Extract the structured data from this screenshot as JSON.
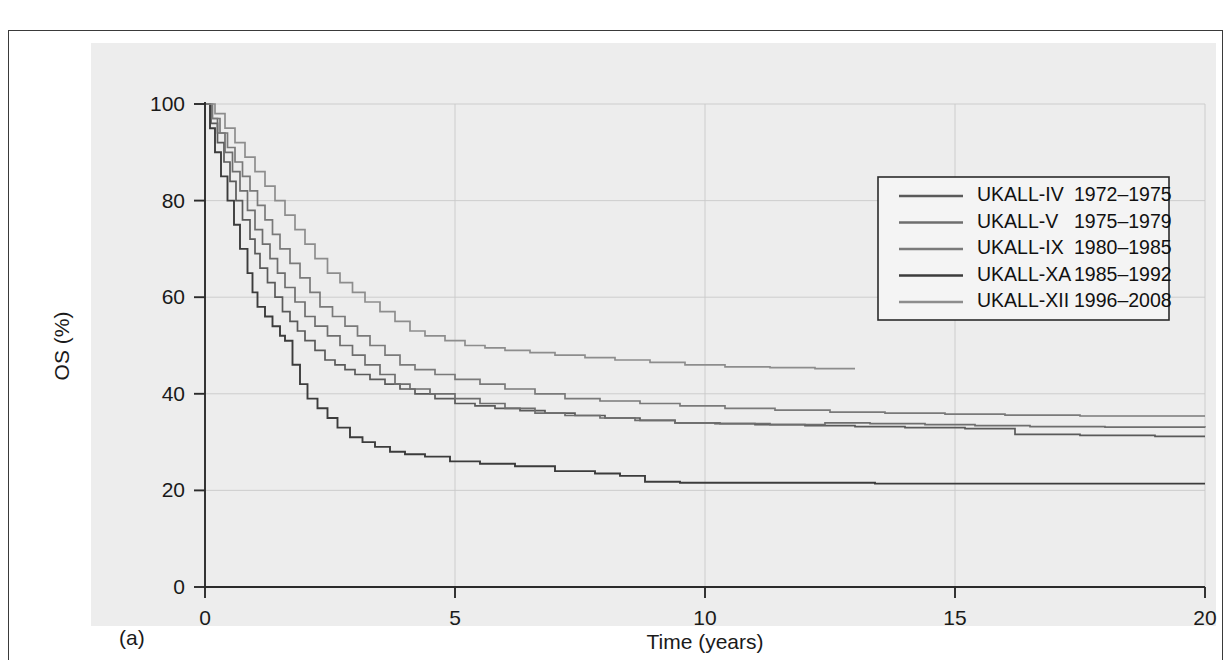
{
  "figure": {
    "panel_label": "(a)",
    "caption_remnant": ""
  },
  "chart_data": {
    "type": "line",
    "subtype": "kaplan-meier-step",
    "title": "",
    "xlabel": "Time (years)",
    "ylabel": "OS (%)",
    "xlim": [
      0,
      20
    ],
    "ylim": [
      0,
      100
    ],
    "xticks": [
      0,
      5,
      10,
      15,
      20
    ],
    "yticks": [
      0,
      20,
      40,
      60,
      80,
      100
    ],
    "xtick_labels": [
      "0",
      "5",
      "10",
      "15",
      "20"
    ],
    "ytick_labels": [
      "0",
      "20",
      "40",
      "60",
      "80",
      "100"
    ],
    "grid": "horizontal-and-vertical-light",
    "legend_position": "top-right-inside",
    "colors": {
      "ukall_iv": "#5a5a5a",
      "ukall_v": "#6e6e6e",
      "ukall_ix": "#7a7a7a",
      "ukall_xa": "#3c3c3c",
      "ukall_xii": "#8d8d8d",
      "axis": "#2b2b2b",
      "grid": "#c9c9c9",
      "panel_background": "#ededed",
      "legend_background": "#f4f4f4"
    },
    "series": [
      {
        "name": "UKALL-IV",
        "trial_label": "UKALL-IV",
        "years": "1972–1975",
        "color": "#5a5a5a",
        "points": [
          [
            0,
            100
          ],
          [
            0.12,
            96
          ],
          [
            0.25,
            92
          ],
          [
            0.38,
            88
          ],
          [
            0.5,
            84
          ],
          [
            0.62,
            80
          ],
          [
            0.75,
            76
          ],
          [
            0.9,
            72
          ],
          [
            1.0,
            69
          ],
          [
            1.1,
            66
          ],
          [
            1.25,
            63
          ],
          [
            1.4,
            60
          ],
          [
            1.55,
            57
          ],
          [
            1.7,
            55
          ],
          [
            1.85,
            53
          ],
          [
            2.0,
            51
          ],
          [
            2.2,
            49
          ],
          [
            2.4,
            47
          ],
          [
            2.6,
            46
          ],
          [
            2.8,
            45
          ],
          [
            3.0,
            44
          ],
          [
            3.3,
            43
          ],
          [
            3.6,
            42
          ],
          [
            3.9,
            41
          ],
          [
            4.2,
            40
          ],
          [
            4.6,
            39
          ],
          [
            5.0,
            38
          ],
          [
            5.4,
            37.5
          ],
          [
            5.8,
            37
          ],
          [
            6.3,
            36.5
          ],
          [
            6.8,
            36
          ],
          [
            7.4,
            35.5
          ],
          [
            8.0,
            35
          ],
          [
            8.7,
            34.5
          ],
          [
            9.4,
            34
          ],
          [
            10.2,
            33.8
          ],
          [
            11.0,
            33.6
          ],
          [
            12.0,
            33.4
          ],
          [
            13.0,
            33.2
          ],
          [
            14.0,
            33.0
          ],
          [
            15.2,
            32.8
          ],
          [
            16.2,
            31.6
          ],
          [
            17.5,
            31.4
          ],
          [
            19.0,
            31.2
          ],
          [
            20,
            31.2
          ]
        ],
        "final_value": 31
      },
      {
        "name": "UKALL-V",
        "trial_label": "UKALL-V",
        "years": "1975–1979",
        "color": "#6e6e6e",
        "points": [
          [
            0,
            100
          ],
          [
            0.12,
            97
          ],
          [
            0.25,
            94
          ],
          [
            0.4,
            90
          ],
          [
            0.55,
            86
          ],
          [
            0.7,
            82
          ],
          [
            0.85,
            78
          ],
          [
            1.0,
            74
          ],
          [
            1.15,
            71
          ],
          [
            1.3,
            68
          ],
          [
            1.45,
            65
          ],
          [
            1.6,
            62
          ],
          [
            1.8,
            59
          ],
          [
            2.0,
            56
          ],
          [
            2.2,
            54
          ],
          [
            2.45,
            52
          ],
          [
            2.7,
            50
          ],
          [
            2.95,
            48
          ],
          [
            3.2,
            46
          ],
          [
            3.5,
            44
          ],
          [
            3.8,
            42
          ],
          [
            4.1,
            41
          ],
          [
            4.5,
            40
          ],
          [
            5.0,
            39
          ],
          [
            5.5,
            38
          ],
          [
            6.0,
            37
          ],
          [
            6.6,
            36
          ],
          [
            7.2,
            35.5
          ],
          [
            7.9,
            35
          ],
          [
            8.6,
            34.5
          ],
          [
            9.4,
            34
          ],
          [
            10.3,
            33.8
          ],
          [
            11.3,
            33.6
          ],
          [
            12.4,
            34
          ],
          [
            13.3,
            33.8
          ],
          [
            14.4,
            33.6
          ],
          [
            15.4,
            33.4
          ],
          [
            16.5,
            33.2
          ],
          [
            18.0,
            33.1
          ],
          [
            20,
            33
          ]
        ],
        "final_value": 33
      },
      {
        "name": "UKALL-IX",
        "trial_label": "UKALL-IX",
        "years": "1980–1985",
        "color": "#7a7a7a",
        "points": [
          [
            0,
            100
          ],
          [
            0.15,
            97
          ],
          [
            0.3,
            94
          ],
          [
            0.45,
            91
          ],
          [
            0.6,
            88
          ],
          [
            0.75,
            85
          ],
          [
            0.9,
            82
          ],
          [
            1.05,
            79
          ],
          [
            1.2,
            76
          ],
          [
            1.35,
            73
          ],
          [
            1.5,
            70
          ],
          [
            1.7,
            67
          ],
          [
            1.9,
            64
          ],
          [
            2.1,
            61
          ],
          [
            2.3,
            58
          ],
          [
            2.55,
            56
          ],
          [
            2.8,
            54
          ],
          [
            3.05,
            52
          ],
          [
            3.3,
            50
          ],
          [
            3.6,
            48
          ],
          [
            3.9,
            46
          ],
          [
            4.2,
            45
          ],
          [
            4.6,
            44
          ],
          [
            5.0,
            43
          ],
          [
            5.5,
            42
          ],
          [
            6.0,
            41
          ],
          [
            6.6,
            40
          ],
          [
            7.2,
            39
          ],
          [
            7.9,
            38.5
          ],
          [
            8.7,
            38
          ],
          [
            9.5,
            37.5
          ],
          [
            10.4,
            37
          ],
          [
            11.4,
            36.6
          ],
          [
            12.5,
            36.2
          ],
          [
            13.6,
            36
          ],
          [
            14.8,
            35.8
          ],
          [
            16.0,
            35.6
          ],
          [
            17.5,
            35.4
          ],
          [
            20,
            35.4
          ]
        ],
        "final_value": 35
      },
      {
        "name": "UKALL-XA",
        "trial_label": "UKALL-XA",
        "years": "1985–1992",
        "color": "#3c3c3c",
        "points": [
          [
            0,
            100
          ],
          [
            0.1,
            95
          ],
          [
            0.2,
            90
          ],
          [
            0.32,
            85
          ],
          [
            0.45,
            80
          ],
          [
            0.58,
            75
          ],
          [
            0.7,
            70
          ],
          [
            0.85,
            65
          ],
          [
            0.95,
            61
          ],
          [
            1.05,
            58
          ],
          [
            1.2,
            56
          ],
          [
            1.35,
            54
          ],
          [
            1.5,
            52
          ],
          [
            1.6,
            51
          ],
          [
            1.75,
            46
          ],
          [
            1.9,
            42
          ],
          [
            2.05,
            39
          ],
          [
            2.25,
            37
          ],
          [
            2.45,
            35
          ],
          [
            2.65,
            33
          ],
          [
            2.9,
            31
          ],
          [
            3.15,
            30
          ],
          [
            3.4,
            29
          ],
          [
            3.7,
            28
          ],
          [
            4.0,
            27.5
          ],
          [
            4.4,
            27
          ],
          [
            4.9,
            26
          ],
          [
            5.5,
            25.5
          ],
          [
            6.2,
            25
          ],
          [
            7.0,
            24
          ],
          [
            7.8,
            23.5
          ],
          [
            8.3,
            23
          ],
          [
            8.8,
            21.8
          ],
          [
            9.5,
            21.6
          ],
          [
            10.5,
            21.6
          ],
          [
            11.5,
            21.6
          ],
          [
            12.5,
            21.6
          ],
          [
            13.0,
            21.6
          ],
          [
            13.4,
            21.4
          ],
          [
            15.0,
            21.4
          ],
          [
            17.0,
            21.4
          ],
          [
            20,
            21.4
          ]
        ],
        "final_value": 21
      },
      {
        "name": "UKALL-XII",
        "trial_label": "UKALL-XII",
        "years": "1996–2008",
        "color": "#8d8d8d",
        "points": [
          [
            0,
            100
          ],
          [
            0.2,
            98
          ],
          [
            0.4,
            95
          ],
          [
            0.6,
            92
          ],
          [
            0.8,
            89
          ],
          [
            1.0,
            86
          ],
          [
            1.2,
            83
          ],
          [
            1.4,
            80
          ],
          [
            1.6,
            77
          ],
          [
            1.8,
            74
          ],
          [
            2.0,
            71
          ],
          [
            2.2,
            68
          ],
          [
            2.45,
            65
          ],
          [
            2.7,
            63
          ],
          [
            2.95,
            61
          ],
          [
            3.2,
            59
          ],
          [
            3.5,
            57
          ],
          [
            3.8,
            55
          ],
          [
            4.1,
            53
          ],
          [
            4.4,
            52
          ],
          [
            4.8,
            51
          ],
          [
            5.2,
            50
          ],
          [
            5.6,
            49.5
          ],
          [
            6.0,
            49
          ],
          [
            6.5,
            48.5
          ],
          [
            7.0,
            48
          ],
          [
            7.6,
            47.5
          ],
          [
            8.2,
            47
          ],
          [
            8.9,
            46.5
          ],
          [
            9.6,
            46
          ],
          [
            10.4,
            45.6
          ],
          [
            11.3,
            45.4
          ],
          [
            12.2,
            45.2
          ],
          [
            13.0,
            45.2
          ]
        ],
        "final_value": 45,
        "truncated_at_x": 13
      }
    ]
  },
  "legend": {
    "entries": [
      {
        "label": "UKALL-IV",
        "years": "1972–1975",
        "color": "#5a5a5a"
      },
      {
        "label": "UKALL-V",
        "years": "1975–1979",
        "color": "#6e6e6e"
      },
      {
        "label": "UKALL-IX",
        "years": "1980–1985",
        "color": "#7a7a7a"
      },
      {
        "label": "UKALL-XA",
        "years": "1985–1992",
        "color": "#3c3c3c"
      },
      {
        "label": "UKALL-XII",
        "years": "1996–2008",
        "color": "#8d8d8d"
      }
    ]
  }
}
